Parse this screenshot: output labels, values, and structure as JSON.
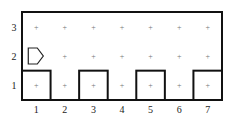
{
  "world": {
    "columns": 7,
    "rows": 3,
    "col_labels": [
      "1",
      "2",
      "3",
      "4",
      "5",
      "6",
      "7"
    ],
    "row_labels": [
      "3",
      "2",
      "1"
    ],
    "corner_marker": "+",
    "robot": {
      "column": 1,
      "row": 2,
      "facing": "east"
    },
    "wall_boxes": [
      {
        "column": 1,
        "row": 1
      },
      {
        "column": 3,
        "row": 1
      },
      {
        "column": 5,
        "row": 1
      },
      {
        "column": 7,
        "row": 1
      }
    ],
    "colors": {
      "wall": "#111111",
      "grid_marker": "#777777",
      "label": "#222222"
    }
  }
}
